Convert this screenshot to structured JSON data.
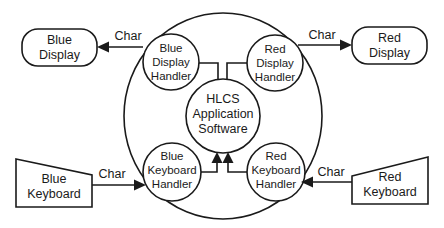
{
  "diagram": {
    "type": "data-flow / context diagram",
    "system_boundary": {
      "label": ""
    },
    "center": {
      "lines": [
        "HLCS",
        "Application",
        "Software"
      ]
    },
    "handlers": {
      "blue_display": {
        "lines": [
          "Blue",
          "Display",
          "Handler"
        ]
      },
      "red_display": {
        "lines": [
          "Red",
          "Display",
          "Handler"
        ]
      },
      "blue_keyboard": {
        "lines": [
          "Blue",
          "Keyboard",
          "Handler"
        ]
      },
      "red_keyboard": {
        "lines": [
          "Red",
          "Keyboard",
          "Handler"
        ]
      }
    },
    "externals": {
      "blue_display": {
        "lines": [
          "Blue",
          "Display"
        ],
        "shape": "rounded-rectangle"
      },
      "red_display": {
        "lines": [
          "Red",
          "Display"
        ],
        "shape": "rounded-rectangle"
      },
      "blue_keyboard": {
        "lines": [
          "Blue",
          "Keyboard"
        ],
        "shape": "manual-input"
      },
      "red_keyboard": {
        "lines": [
          "Red",
          "Keyboard"
        ],
        "shape": "manual-input"
      }
    },
    "flows": {
      "blue_display_out": {
        "label": "Char",
        "from": "Blue Display Handler",
        "to": "Blue Display"
      },
      "red_display_out": {
        "label": "Char",
        "from": "Red Display Handler",
        "to": "Red Display"
      },
      "blue_keyboard_in": {
        "label": "Char",
        "from": "Blue Keyboard",
        "to": "Blue Keyboard Handler"
      },
      "red_keyboard_in": {
        "label": "Char",
        "from": "Red Keyboard",
        "to": "Red Keyboard Handler"
      }
    },
    "colors": {
      "stroke": "#1a1a1a",
      "background": "#ffffff"
    }
  }
}
